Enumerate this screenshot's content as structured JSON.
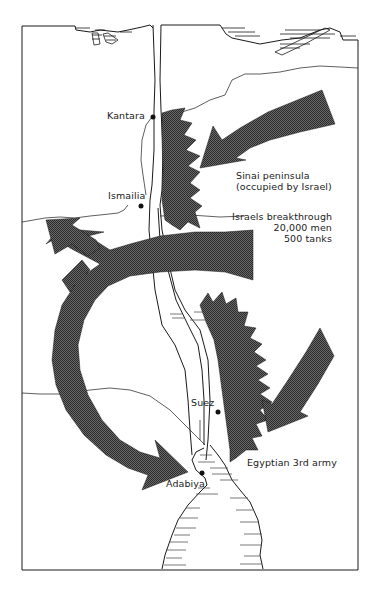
{
  "map": {
    "colors": {
      "ink": "#1a1a1a",
      "arrow_fill": "#4a4a4a",
      "background": "#ffffff"
    },
    "places": [
      {
        "id": "kantara",
        "label": "Kantara"
      },
      {
        "id": "ismailia",
        "label": "Ismailia"
      },
      {
        "id": "suez",
        "label": "Suez"
      },
      {
        "id": "adabiya",
        "label": "Adabiya"
      }
    ],
    "annotations": {
      "sinai_line1": "Sinai peninsula",
      "sinai_line2": "(occupied by Israel)",
      "breakthrough_line1": "Israels breakthrough",
      "breakthrough_line2": "20,000 men",
      "breakthrough_line3": "500 tanks",
      "egyptian_army": "Egyptian 3rd army"
    }
  }
}
